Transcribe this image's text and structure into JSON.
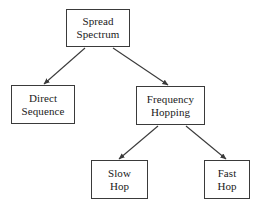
{
  "diagram": {
    "type": "tree",
    "stroke_color": "#3a3a3a",
    "text_color": "#1a1a1a",
    "background_color": "#ffffff",
    "nodes": [
      {
        "id": "spread-spectrum",
        "line1": "Spread",
        "line2": "Spectrum",
        "x": 66,
        "y": 9,
        "w": 64,
        "h": 38,
        "level": 0
      },
      {
        "id": "direct-sequence",
        "line1": "Direct",
        "line2": "Sequence",
        "x": 11,
        "y": 85,
        "w": 64,
        "h": 39,
        "level": 1
      },
      {
        "id": "frequency-hopping",
        "line1": "Frequency",
        "line2": "Hopping",
        "x": 136,
        "y": 86,
        "w": 69,
        "h": 39,
        "level": 1
      },
      {
        "id": "slow-hop",
        "line1": "Slow",
        "line2": "Hop",
        "x": 91,
        "y": 160,
        "w": 57,
        "h": 39,
        "level": 2
      },
      {
        "id": "fast-hop",
        "line1": "Fast",
        "line2": "Hop",
        "x": 204,
        "y": 160,
        "w": 46,
        "h": 39,
        "level": 2
      }
    ],
    "edges": [
      {
        "id": "spread-to-direct",
        "from": "spread-spectrum",
        "to": "direct-sequence",
        "x1": 85,
        "y1": 48,
        "x2": 44,
        "y2": 84
      },
      {
        "id": "spread-to-frequency",
        "from": "spread-spectrum",
        "to": "frequency-hopping",
        "x1": 113,
        "y1": 48,
        "x2": 168,
        "y2": 85
      },
      {
        "id": "frequency-to-slow",
        "from": "frequency-hopping",
        "to": "slow-hop",
        "x1": 158,
        "y1": 126,
        "x2": 119,
        "y2": 159
      },
      {
        "id": "frequency-to-fast",
        "from": "frequency-hopping",
        "to": "fast-hop",
        "x1": 186,
        "y1": 126,
        "x2": 226,
        "y2": 159
      }
    ]
  }
}
